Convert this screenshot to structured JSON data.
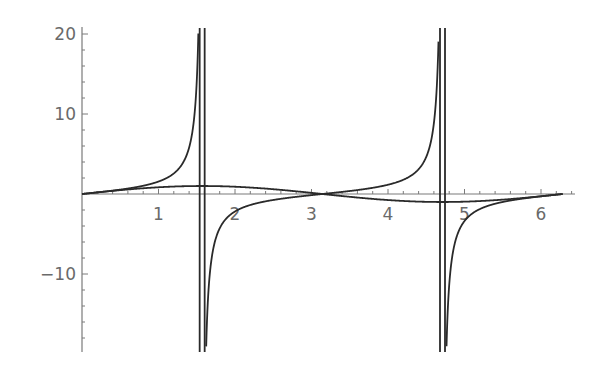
{
  "chart_data": {
    "type": "line",
    "title": "",
    "xlabel": "",
    "ylabel": "",
    "xlim": [
      0,
      6.4
    ],
    "ylim": [
      -19.75,
      20.75
    ],
    "grid": false,
    "legend": null,
    "x_ticks": {
      "major": [
        1,
        2,
        3,
        4,
        5,
        6
      ],
      "labels": [
        "1",
        "2",
        "3",
        "4",
        "5",
        "6"
      ],
      "minor_step": 0.2
    },
    "y_ticks": {
      "major": [
        -10,
        10,
        20
      ],
      "labels": [
        "-10",
        "10",
        "20"
      ],
      "minor_step": 2
    },
    "series": [
      {
        "name": "tan(x)",
        "function": "tan",
        "domain": [
          0,
          6.2832
        ],
        "asymptotes": [
          1.5708,
          4.7124
        ],
        "sample_points": [
          [
            0,
            0
          ],
          [
            0.5,
            0.546
          ],
          [
            1.0,
            1.557
          ],
          [
            1.3,
            3.602
          ],
          [
            1.5,
            14.1
          ],
          [
            1.65,
            -12.43
          ],
          [
            2.0,
            -2.185
          ],
          [
            2.5,
            -0.747
          ],
          [
            3.1416,
            0
          ],
          [
            3.5,
            0.375
          ],
          [
            4.0,
            1.158
          ],
          [
            4.5,
            4.637
          ],
          [
            4.65,
            15.9
          ],
          [
            4.8,
            -11.38
          ],
          [
            5.0,
            -3.381
          ],
          [
            5.5,
            -0.996
          ],
          [
            6.0,
            -0.291
          ],
          [
            6.2832,
            0
          ]
        ]
      },
      {
        "name": "sin(x)",
        "function": "sin",
        "domain": [
          0,
          6.2832
        ],
        "sample_points": [
          [
            0,
            0
          ],
          [
            0.5,
            0.479
          ],
          [
            1.0,
            0.841
          ],
          [
            1.5708,
            1.0
          ],
          [
            2.0,
            0.909
          ],
          [
            2.5,
            0.598
          ],
          [
            3.1416,
            0
          ],
          [
            3.5,
            -0.351
          ],
          [
            4.0,
            -0.757
          ],
          [
            4.7124,
            -1.0
          ],
          [
            5.0,
            -0.959
          ],
          [
            5.5,
            -0.706
          ],
          [
            6.0,
            -0.279
          ],
          [
            6.2832,
            0
          ]
        ]
      }
    ]
  },
  "layout": {
    "origin_px": [
      82,
      194
    ],
    "x_scale_px": 76.5,
    "y_scale_px": 8,
    "x_axis_end_px": 575,
    "y_axis_top_px": 27,
    "y_axis_bottom_px": 352
  }
}
